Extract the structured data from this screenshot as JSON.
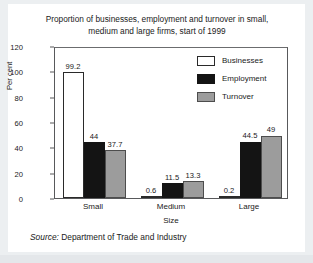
{
  "chart_data": {
    "type": "bar",
    "title": "Proportion of businesses, employment and turnover in small, medium and large firms, start of 1999",
    "title_line1": "Proportion of businesses, employment and turnover in small,",
    "title_line2": "medium and large firms, start of 1999",
    "xlabel": "Size",
    "ylabel": "Per cent",
    "categories": [
      "Small",
      "Medium",
      "Large"
    ],
    "series": [
      {
        "name": "Businesses",
        "values": [
          99.2,
          0.6,
          0.2
        ],
        "color": "#ffffff"
      },
      {
        "name": "Employment",
        "values": [
          44,
          11.5,
          44.5
        ],
        "color": "#141414"
      },
      {
        "name": "Turnover",
        "values": [
          37.7,
          13.3,
          49
        ],
        "color": "#9c9c9c"
      }
    ],
    "value_labels": [
      [
        "99.2",
        "0.6",
        "0.2"
      ],
      [
        "44",
        "11.5",
        "44.5"
      ],
      [
        "37.7",
        "13.3",
        "49"
      ]
    ],
    "ylim": [
      0,
      120
    ],
    "yticks": [
      0,
      20,
      40,
      60,
      80,
      100,
      120
    ],
    "ytick_labels": [
      "0",
      "20",
      "40",
      "60",
      "80",
      "100",
      "120"
    ],
    "grid": false,
    "legend_position": "top-right"
  },
  "source": {
    "prefix": "Source:",
    "text": "Department of Trade and Industry"
  }
}
